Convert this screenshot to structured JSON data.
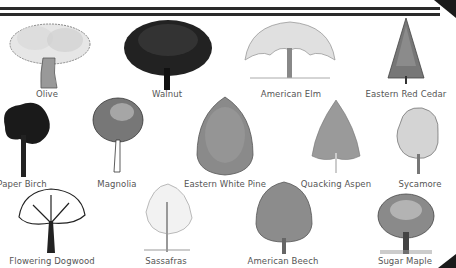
{
  "trees": [
    {
      "name": "Olive",
      "style": "light-sketch",
      "shape": "spread"
    },
    {
      "name": "Walnut",
      "style": "dark",
      "shape": "round"
    },
    {
      "name": "American Elm",
      "style": "light-sketch",
      "shape": "vase"
    },
    {
      "name": "Eastern Red Cedar",
      "style": "medium",
      "shape": "conical"
    },
    {
      "name": "Paper Birch",
      "style": "dark",
      "shape": "irregular"
    },
    {
      "name": "Magnolia",
      "style": "medium",
      "shape": "oval"
    },
    {
      "name": "Eastern White Pine",
      "style": "medium",
      "shape": "columnar"
    },
    {
      "name": "Quacking Aspen",
      "style": "light",
      "shape": "pyramidal"
    },
    {
      "name": "Sycamore",
      "style": "light-sketch",
      "shape": "irregular"
    },
    {
      "name": "Flowering Dogwood",
      "style": "dark-outline",
      "shape": "spread"
    },
    {
      "name": "Sassafras",
      "style": "light-sketch",
      "shape": "open"
    },
    {
      "name": "American Beech",
      "style": "medium",
      "shape": "dome"
    },
    {
      "name": "Sugar Maple",
      "style": "medium",
      "shape": "round"
    }
  ]
}
